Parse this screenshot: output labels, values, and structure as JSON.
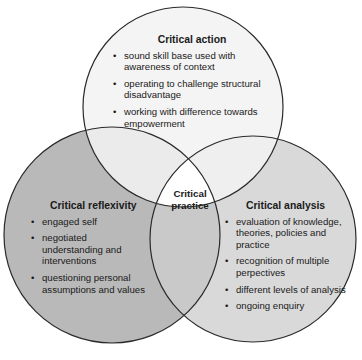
{
  "colors": {
    "background": "#ffffff",
    "outline": "#2a2a2a",
    "critical_action_fill": "#f4f4f4",
    "critical_reflexivity_fill": "#b9b9b9",
    "critical_analysis_fill": "#d9d9d9",
    "reflexivity_analysis_overlap": "#c8c8c8",
    "center_fill": "#ffffff"
  },
  "circles": {
    "critical_action": {
      "title": "Critical action",
      "items": [
        "sound skill base used with awareness of context",
        "operating to challenge structural disadvantage",
        "working with difference towards empowerment"
      ]
    },
    "critical_reflexivity": {
      "title": "Critical reflexivity",
      "items": [
        "engaged self",
        "negotiated understanding and interventions",
        "questioning personal assumptions and values"
      ]
    },
    "critical_analysis": {
      "title": "Critical analysis",
      "items": [
        "evaluation of knowledge, theories, policies and practice",
        "recognition of multiple perpectives",
        "different levels of analysis",
        "ongoing enquiry"
      ]
    }
  },
  "center": {
    "line1": "Critical",
    "line2": "practice"
  }
}
